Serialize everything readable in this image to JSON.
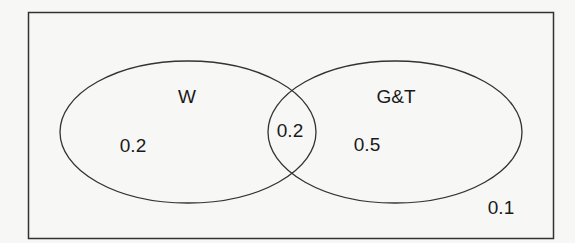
{
  "diagram": {
    "type": "venn",
    "universe": {
      "label": "",
      "outside_value": "0.1"
    },
    "sets": [
      {
        "name": "W",
        "only_value": "0.2"
      },
      {
        "name": "G&T",
        "only_value": "0.5"
      }
    ],
    "intersection_value": "0.2"
  }
}
